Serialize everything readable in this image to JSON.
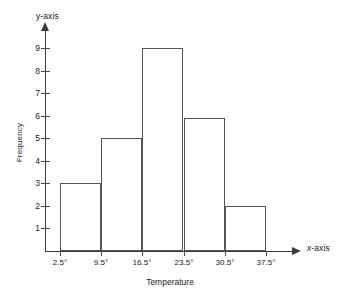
{
  "chart_data": {
    "type": "bar",
    "title": "",
    "subtitle": "",
    "xlabel": "Temperature",
    "ylabel": "Frequency",
    "x_axis_name": "x-axis",
    "y_axis_name": "y-axis",
    "grid": false,
    "legend": null,
    "xlim": [
      0,
      42
    ],
    "ylim": [
      0,
      9.8
    ],
    "x_tick_labels": [
      "2.5°",
      "9.5°",
      "16.5°",
      "23.5°",
      "30.5°",
      "37.5°"
    ],
    "x_tick_values": [
      2.5,
      9.5,
      16.5,
      23.5,
      30.5,
      37.5
    ],
    "y_tick_labels": [
      "1",
      "2",
      "3",
      "4",
      "5",
      "6",
      "7",
      "8",
      "9"
    ],
    "y_tick_values": [
      1,
      2,
      3,
      4,
      5,
      6,
      7,
      8,
      9
    ],
    "bin_edges": [
      2.5,
      9.5,
      16.5,
      23.5,
      30.5,
      37.5
    ],
    "categories": [
      "2.5°-9.5°",
      "9.5°-16.5°",
      "16.5°-23.5°",
      "23.5°-30.5°",
      "30.5°-37.5°"
    ],
    "values": [
      3,
      5,
      9,
      5.9,
      2
    ],
    "bar_color": "#ffffff",
    "bar_edge_color": "#555555",
    "axis_color": "#3a3a3a",
    "text_color": "#1a1a1a",
    "background": "#ffffff"
  }
}
